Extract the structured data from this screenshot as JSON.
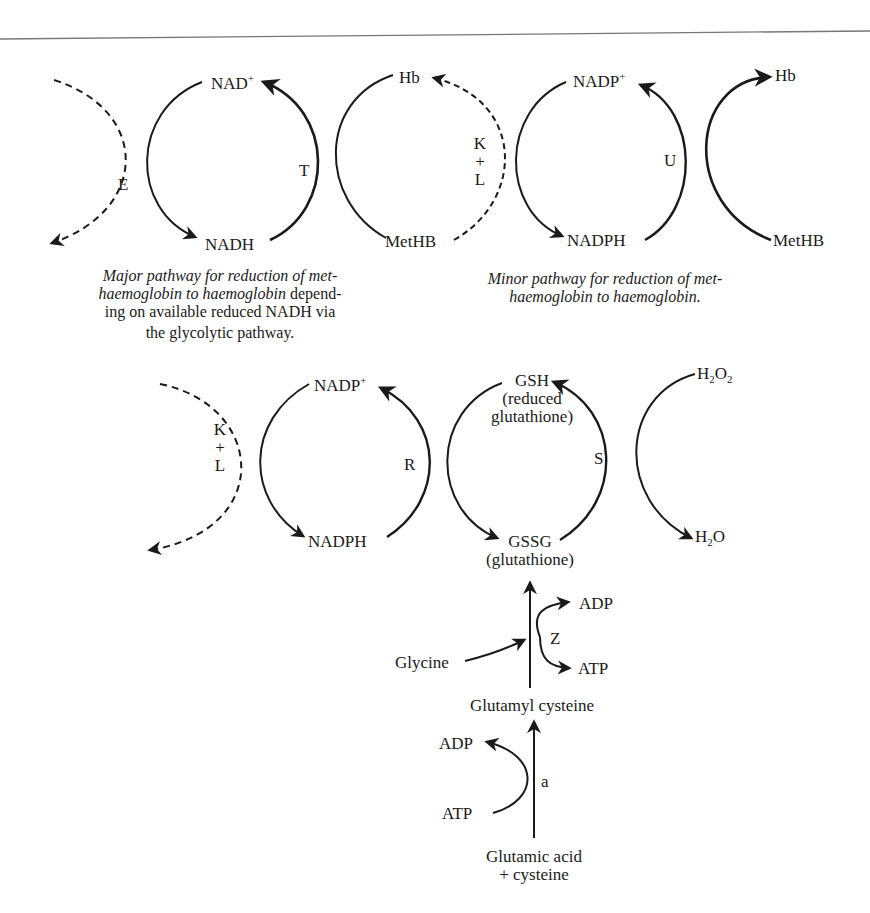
{
  "diagram": {
    "top_left": {
      "enzyme_E": "E",
      "cofactor_oxidized": "NAD",
      "cofactor_oxidized_charge": "+",
      "cofactor_reduced": "NADH",
      "enzyme_T": "T",
      "hb": "Hb",
      "methb": "MetHB",
      "enzyme_K": "K",
      "enzyme_plus": "+",
      "enzyme_L": "L",
      "caption_italic_1": "Major pathway for reduction of met-",
      "caption_italic_2": "haemoglobin to haemoglobin",
      "caption_plain_2": " depend-",
      "caption_3": "ing on available reduced NADH via",
      "caption_4": "the glycolytic pathway."
    },
    "top_right": {
      "cofactor_oxidized": "NADP",
      "cofactor_oxidized_charge": "+",
      "cofactor_reduced": "NADPH",
      "enzyme_U": "U",
      "hb": "Hb",
      "methb": "MetHB",
      "caption_1": "Minor pathway for reduction of met-",
      "caption_2": "haemoglobin to haemoglobin."
    },
    "middle": {
      "enzyme_K": "K",
      "enzyme_plus": "+",
      "enzyme_L": "L",
      "cofactor_oxidized": "NADP",
      "cofactor_oxidized_charge": "+",
      "cofactor_reduced": "NADPH",
      "enzyme_R": "R",
      "gsh": "GSH",
      "gsh_note_1": "(reduced",
      "gsh_note_2": "glutathione)",
      "gssg": "GSSG",
      "gssg_note": "(glutathione)",
      "enzyme_S": "S",
      "h2o2_H": "H",
      "h2o2_sub1": "2",
      "h2o2_O": "O",
      "h2o2_sub2": "2",
      "h2o_H": "H",
      "h2o_sub": "2",
      "h2o_O": "O"
    },
    "synthesis": {
      "glycine": "Glycine",
      "enzyme_Z": "Z",
      "adp_top": "ADP",
      "atp_top": "ATP",
      "glutamyl_cysteine": "Glutamyl cysteine",
      "adp_bottom": "ADP",
      "atp_bottom": "ATP",
      "enzyme_a": "a",
      "substrate_1": "Glutamic acid",
      "substrate_2": "+ cysteine"
    }
  }
}
